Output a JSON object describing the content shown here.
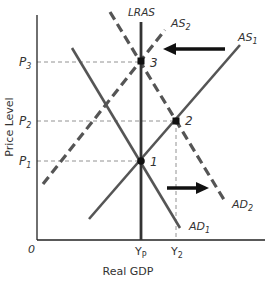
{
  "diagram": {
    "type": "AD-AS model",
    "axes": {
      "x_label": "Real GDP",
      "y_label": "Price Level",
      "origin": "0"
    },
    "y_ticks": [
      {
        "label": "P",
        "sub": "3"
      },
      {
        "label": "P",
        "sub": "2"
      },
      {
        "label": "P",
        "sub": "1"
      }
    ],
    "x_ticks": [
      {
        "label": "Y",
        "sub": "P"
      },
      {
        "label": "Y",
        "sub": "2"
      }
    ],
    "curves": {
      "lras": "LRAS",
      "as1": {
        "label": "AS",
        "sub": "1"
      },
      "as2": {
        "label": "AS",
        "sub": "2"
      },
      "ad1": {
        "label": "AD",
        "sub": "1"
      },
      "ad2": {
        "label": "AD",
        "sub": "2"
      }
    },
    "points": [
      "1",
      "2",
      "3"
    ],
    "colors": {
      "curve": "#555555",
      "axis": "#222222",
      "arrow": "#111111",
      "guide": "#777777"
    }
  }
}
